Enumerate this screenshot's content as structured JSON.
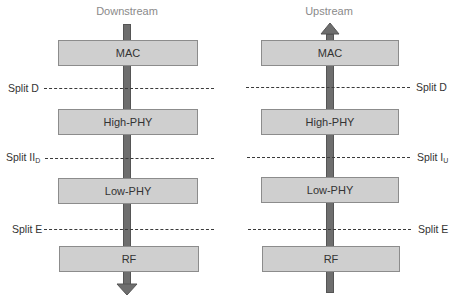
{
  "diagram": {
    "type": "protocol-stack-split-options",
    "colors": {
      "layer_fill": "#cfcfcf",
      "layer_border": "#8c8c8c",
      "arrow": "#6e6e6e",
      "dash": "#3a3a3a",
      "title": "#8a8a8a"
    },
    "downstream": {
      "title": "Downstream",
      "direction": "down",
      "layers": [
        "MAC",
        "High-PHY",
        "Low-PHY",
        "RF"
      ],
      "splits": [
        {
          "label": "Split D",
          "sub": ""
        },
        {
          "label": "Split II",
          "sub": "D"
        },
        {
          "label": "Split E",
          "sub": ""
        }
      ]
    },
    "upstream": {
      "title": "Upstream",
      "direction": "up",
      "layers": [
        "MAC",
        "High-PHY",
        "Low-PHY",
        "RF"
      ],
      "splits": [
        {
          "label": "Split D",
          "sub": ""
        },
        {
          "label": "Split I",
          "sub": "U"
        },
        {
          "label": "Split E",
          "sub": ""
        }
      ]
    }
  }
}
